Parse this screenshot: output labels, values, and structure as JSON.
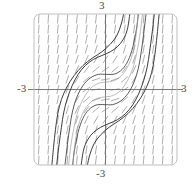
{
  "figure": {
    "kind": "slope-field",
    "title": "",
    "frame": {
      "x0": 34,
      "y0": 14,
      "x1": 177,
      "y1": 165,
      "corner_radius": 6,
      "stroke": "#b8b8b8"
    },
    "origin_px": {
      "x": 105.5,
      "y": 89.5
    },
    "axis_color": "#6e6e6e",
    "field_color": "#9a9a9a",
    "curve_color": "#3b3b3b",
    "background": "#ffffff"
  },
  "axes": {
    "x_label_left": "-3",
    "x_label_right": "3",
    "y_label_top": "3",
    "y_label_bottom": "-3",
    "xlim": [
      -3,
      3
    ],
    "ylim": [
      -3,
      3
    ],
    "x_axis_visible": true,
    "y_axis_visible": true,
    "grid": false
  },
  "chart_data": {
    "type": "line",
    "title": "",
    "xlabel": "",
    "ylabel": "",
    "xlim": [
      -3,
      3
    ],
    "ylim": [
      -3,
      3
    ],
    "grid": false,
    "legend": "none",
    "tick_labels": {
      "x": [
        "-3",
        "3"
      ],
      "y": [
        "-3",
        "3"
      ]
    },
    "slope_field": {
      "equation": "dy/dx = x^2 + y^2",
      "description": "short dashes of unit length drawn at grid points, slope = x^2 + y^2; nearly horizontal near the origin and nearly vertical far from it",
      "nx": 15,
      "ny": 15,
      "dash_length_px": 9,
      "dash_width_px": 0.8
    },
    "series": [
      {
        "name": "solution-curve-upper-left",
        "comment": "S-shaped solution passing through roughly (-2.0,-2.6) rising through (-1.4,0.2) to (-0.4,1.6) then steeply up",
        "points": [
          [
            -2.05,
            -3.0
          ],
          [
            -1.95,
            -2.2
          ],
          [
            -1.85,
            -1.5
          ],
          [
            -1.75,
            -0.9
          ],
          [
            -1.6,
            -0.35
          ],
          [
            -1.4,
            0.15
          ],
          [
            -1.15,
            0.6
          ],
          [
            -0.85,
            0.95
          ],
          [
            -0.5,
            1.2
          ],
          [
            -0.15,
            1.35
          ],
          [
            0.2,
            1.5
          ],
          [
            0.5,
            1.7
          ],
          [
            0.75,
            2.0
          ],
          [
            0.92,
            2.4
          ],
          [
            1.02,
            3.0
          ]
        ]
      },
      {
        "name": "solution-curve-lower-right",
        "comment": "mirror image: rises from bottom near x=0.1 then through (0.6,-1.2) and up past (2.0,2.6)",
        "points": [
          [
            -1.02,
            -3.0
          ],
          [
            -0.92,
            -2.4
          ],
          [
            -0.75,
            -2.0
          ],
          [
            -0.5,
            -1.7
          ],
          [
            -0.2,
            -1.5
          ],
          [
            0.15,
            -1.35
          ],
          [
            0.5,
            -1.2
          ],
          [
            0.85,
            -0.95
          ],
          [
            1.15,
            -0.6
          ],
          [
            1.4,
            -0.15
          ],
          [
            1.6,
            0.35
          ],
          [
            1.75,
            0.9
          ],
          [
            1.85,
            1.5
          ],
          [
            1.95,
            2.2
          ],
          [
            2.05,
            3.0
          ]
        ]
      },
      {
        "name": "solution-curve-inner-upper",
        "comment": "flatter interior curve, local max near (-0.4,0.55), dips to saddle near origin",
        "points": [
          [
            -1.7,
            -3.0
          ],
          [
            -1.6,
            -2.2
          ],
          [
            -1.5,
            -1.5
          ],
          [
            -1.38,
            -0.85
          ],
          [
            -1.2,
            -0.3
          ],
          [
            -0.95,
            0.15
          ],
          [
            -0.65,
            0.45
          ],
          [
            -0.3,
            0.6
          ],
          [
            0.05,
            0.6
          ],
          [
            0.4,
            0.62
          ],
          [
            0.7,
            0.8
          ],
          [
            0.95,
            1.15
          ],
          [
            1.15,
            1.7
          ],
          [
            1.3,
            2.4
          ],
          [
            1.38,
            3.0
          ]
        ]
      },
      {
        "name": "solution-curve-inner-lower",
        "comment": "mirror of inner-upper through the origin",
        "points": [
          [
            -1.38,
            -3.0
          ],
          [
            -1.3,
            -2.4
          ],
          [
            -1.15,
            -1.7
          ],
          [
            -0.95,
            -1.15
          ],
          [
            -0.7,
            -0.8
          ],
          [
            -0.4,
            -0.62
          ],
          [
            -0.05,
            -0.6
          ],
          [
            0.3,
            -0.6
          ],
          [
            0.65,
            -0.45
          ],
          [
            0.95,
            -0.15
          ],
          [
            1.2,
            0.3
          ],
          [
            1.38,
            0.85
          ],
          [
            1.5,
            1.5
          ],
          [
            1.6,
            2.2
          ],
          [
            1.7,
            3.0
          ]
        ]
      },
      {
        "name": "solution-curve-outer-left",
        "comment": "outermost left branch hugging the inflection band",
        "points": [
          [
            -2.25,
            -3.0
          ],
          [
            -2.18,
            -2.3
          ],
          [
            -2.1,
            -1.6
          ],
          [
            -2.0,
            -0.95
          ],
          [
            -1.85,
            -0.4
          ],
          [
            -1.62,
            0.1
          ],
          [
            -1.32,
            0.55
          ],
          [
            -0.95,
            0.95
          ],
          [
            -0.55,
            1.25
          ],
          [
            -0.15,
            1.5
          ],
          [
            0.2,
            1.8
          ],
          [
            0.48,
            2.15
          ],
          [
            0.66,
            2.6
          ],
          [
            0.76,
            3.0
          ]
        ]
      },
      {
        "name": "solution-curve-outer-right",
        "comment": "outermost right branch, mirror of outer-left",
        "points": [
          [
            -0.76,
            -3.0
          ],
          [
            -0.66,
            -2.6
          ],
          [
            -0.48,
            -2.15
          ],
          [
            -0.2,
            -1.8
          ],
          [
            0.15,
            -1.5
          ],
          [
            0.55,
            -1.25
          ],
          [
            0.95,
            -0.95
          ],
          [
            1.32,
            -0.55
          ],
          [
            1.62,
            -0.1
          ],
          [
            1.85,
            0.4
          ],
          [
            2.0,
            0.95
          ],
          [
            2.1,
            1.6
          ],
          [
            2.18,
            2.3
          ],
          [
            2.25,
            3.0
          ]
        ]
      },
      {
        "name": "solution-curve-faint-upper",
        "comment": "light grey auxiliary curve slightly inside the inner-upper arc",
        "points": [
          [
            -1.55,
            -3.0
          ],
          [
            -1.45,
            -2.2
          ],
          [
            -1.32,
            -1.5
          ],
          [
            -1.15,
            -0.85
          ],
          [
            -0.92,
            -0.35
          ],
          [
            -0.62,
            0.05
          ],
          [
            -0.28,
            0.25
          ],
          [
            0.08,
            0.3
          ],
          [
            0.42,
            0.38
          ],
          [
            0.72,
            0.6
          ],
          [
            0.98,
            1.0
          ],
          [
            1.18,
            1.6
          ],
          [
            1.3,
            2.3
          ],
          [
            1.36,
            3.0
          ]
        ]
      },
      {
        "name": "solution-curve-faint-lower",
        "comment": "light grey auxiliary curve, mirror of faint-upper",
        "points": [
          [
            -1.36,
            -3.0
          ],
          [
            -1.3,
            -2.3
          ],
          [
            -1.18,
            -1.6
          ],
          [
            -0.98,
            -1.0
          ],
          [
            -0.72,
            -0.6
          ],
          [
            -0.42,
            -0.38
          ],
          [
            -0.08,
            -0.3
          ],
          [
            0.28,
            -0.25
          ],
          [
            0.62,
            -0.05
          ],
          [
            0.92,
            0.35
          ],
          [
            1.15,
            0.85
          ],
          [
            1.32,
            1.5
          ],
          [
            1.45,
            2.2
          ],
          [
            1.55,
            3.0
          ]
        ]
      }
    ]
  }
}
